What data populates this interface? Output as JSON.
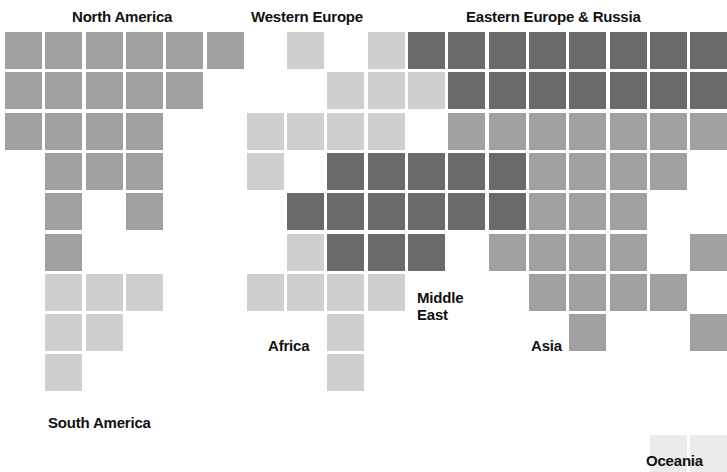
{
  "chart_data": {
    "type": "heatmap",
    "title": "",
    "subtitle": "",
    "xlabel": "",
    "ylabel": "",
    "grid": false,
    "legend_position": "none",
    "cell_size": 37,
    "cell_pitch": 40.3,
    "origin": {
      "x": 5,
      "y": 32
    },
    "columns": 18,
    "rows": 10,
    "shades": {
      "light": "#cfcfcf",
      "medium": "#a0a0a0",
      "dark": "#6a6a6a",
      "pale": "#ebebeb"
    },
    "categories": [
      "North America",
      "South America",
      "Western Europe",
      "Eastern Europe & Russia",
      "Africa",
      "Middle East",
      "Asia",
      "Oceania"
    ],
    "cells": [
      {
        "r": 0,
        "c": 0,
        "v": "medium"
      },
      {
        "r": 0,
        "c": 1,
        "v": "medium"
      },
      {
        "r": 0,
        "c": 2,
        "v": "medium"
      },
      {
        "r": 0,
        "c": 3,
        "v": "medium"
      },
      {
        "r": 0,
        "c": 4,
        "v": "medium"
      },
      {
        "r": 0,
        "c": 5,
        "v": "medium"
      },
      {
        "r": 0,
        "c": 7,
        "v": "light"
      },
      {
        "r": 0,
        "c": 9,
        "v": "light"
      },
      {
        "r": 0,
        "c": 10,
        "v": "dark"
      },
      {
        "r": 0,
        "c": 11,
        "v": "dark"
      },
      {
        "r": 0,
        "c": 12,
        "v": "dark"
      },
      {
        "r": 0,
        "c": 13,
        "v": "dark"
      },
      {
        "r": 0,
        "c": 14,
        "v": "dark"
      },
      {
        "r": 0,
        "c": 15,
        "v": "dark"
      },
      {
        "r": 0,
        "c": 16,
        "v": "dark"
      },
      {
        "r": 0,
        "c": 17,
        "v": "dark"
      },
      {
        "r": 1,
        "c": 0,
        "v": "medium"
      },
      {
        "r": 1,
        "c": 1,
        "v": "medium"
      },
      {
        "r": 1,
        "c": 2,
        "v": "medium"
      },
      {
        "r": 1,
        "c": 3,
        "v": "medium"
      },
      {
        "r": 1,
        "c": 4,
        "v": "medium"
      },
      {
        "r": 1,
        "c": 8,
        "v": "light"
      },
      {
        "r": 1,
        "c": 9,
        "v": "light"
      },
      {
        "r": 1,
        "c": 10,
        "v": "light"
      },
      {
        "r": 1,
        "c": 11,
        "v": "dark"
      },
      {
        "r": 1,
        "c": 12,
        "v": "dark"
      },
      {
        "r": 1,
        "c": 13,
        "v": "dark"
      },
      {
        "r": 1,
        "c": 14,
        "v": "dark"
      },
      {
        "r": 1,
        "c": 15,
        "v": "dark"
      },
      {
        "r": 1,
        "c": 16,
        "v": "dark"
      },
      {
        "r": 1,
        "c": 17,
        "v": "dark"
      },
      {
        "r": 2,
        "c": 0,
        "v": "medium"
      },
      {
        "r": 2,
        "c": 1,
        "v": "medium"
      },
      {
        "r": 2,
        "c": 2,
        "v": "medium"
      },
      {
        "r": 2,
        "c": 3,
        "v": "medium"
      },
      {
        "r": 2,
        "c": 6,
        "v": "light"
      },
      {
        "r": 2,
        "c": 7,
        "v": "light"
      },
      {
        "r": 2,
        "c": 8,
        "v": "light"
      },
      {
        "r": 2,
        "c": 9,
        "v": "light"
      },
      {
        "r": 2,
        "c": 11,
        "v": "medium"
      },
      {
        "r": 2,
        "c": 12,
        "v": "medium"
      },
      {
        "r": 2,
        "c": 13,
        "v": "medium"
      },
      {
        "r": 2,
        "c": 14,
        "v": "medium"
      },
      {
        "r": 2,
        "c": 15,
        "v": "medium"
      },
      {
        "r": 2,
        "c": 16,
        "v": "medium"
      },
      {
        "r": 2,
        "c": 17,
        "v": "medium"
      },
      {
        "r": 3,
        "c": 1,
        "v": "medium"
      },
      {
        "r": 3,
        "c": 2,
        "v": "medium"
      },
      {
        "r": 3,
        "c": 3,
        "v": "medium"
      },
      {
        "r": 3,
        "c": 6,
        "v": "light"
      },
      {
        "r": 3,
        "c": 8,
        "v": "dark"
      },
      {
        "r": 3,
        "c": 9,
        "v": "dark"
      },
      {
        "r": 3,
        "c": 10,
        "v": "dark"
      },
      {
        "r": 3,
        "c": 11,
        "v": "dark"
      },
      {
        "r": 3,
        "c": 12,
        "v": "dark"
      },
      {
        "r": 3,
        "c": 13,
        "v": "medium"
      },
      {
        "r": 3,
        "c": 14,
        "v": "medium"
      },
      {
        "r": 3,
        "c": 15,
        "v": "medium"
      },
      {
        "r": 3,
        "c": 16,
        "v": "medium"
      },
      {
        "r": 4,
        "c": 1,
        "v": "medium"
      },
      {
        "r": 4,
        "c": 3,
        "v": "medium"
      },
      {
        "r": 4,
        "c": 7,
        "v": "dark"
      },
      {
        "r": 4,
        "c": 8,
        "v": "dark"
      },
      {
        "r": 4,
        "c": 9,
        "v": "dark"
      },
      {
        "r": 4,
        "c": 10,
        "v": "dark"
      },
      {
        "r": 4,
        "c": 11,
        "v": "dark"
      },
      {
        "r": 4,
        "c": 12,
        "v": "dark"
      },
      {
        "r": 4,
        "c": 13,
        "v": "medium"
      },
      {
        "r": 4,
        "c": 14,
        "v": "medium"
      },
      {
        "r": 4,
        "c": 15,
        "v": "medium"
      },
      {
        "r": 5,
        "c": 1,
        "v": "medium"
      },
      {
        "r": 5,
        "c": 7,
        "v": "light"
      },
      {
        "r": 5,
        "c": 8,
        "v": "dark"
      },
      {
        "r": 5,
        "c": 9,
        "v": "dark"
      },
      {
        "r": 5,
        "c": 10,
        "v": "dark"
      },
      {
        "r": 5,
        "c": 12,
        "v": "medium"
      },
      {
        "r": 5,
        "c": 13,
        "v": "medium"
      },
      {
        "r": 5,
        "c": 14,
        "v": "medium"
      },
      {
        "r": 5,
        "c": 15,
        "v": "medium"
      },
      {
        "r": 5,
        "c": 17,
        "v": "medium"
      },
      {
        "r": 6,
        "c": 1,
        "v": "light"
      },
      {
        "r": 6,
        "c": 2,
        "v": "light"
      },
      {
        "r": 6,
        "c": 3,
        "v": "light"
      },
      {
        "r": 6,
        "c": 6,
        "v": "light"
      },
      {
        "r": 6,
        "c": 7,
        "v": "light"
      },
      {
        "r": 6,
        "c": 8,
        "v": "light"
      },
      {
        "r": 6,
        "c": 9,
        "v": "light"
      },
      {
        "r": 6,
        "c": 13,
        "v": "medium"
      },
      {
        "r": 6,
        "c": 14,
        "v": "medium"
      },
      {
        "r": 6,
        "c": 15,
        "v": "medium"
      },
      {
        "r": 6,
        "c": 16,
        "v": "medium"
      },
      {
        "r": 7,
        "c": 1,
        "v": "light"
      },
      {
        "r": 7,
        "c": 2,
        "v": "light"
      },
      {
        "r": 7,
        "c": 8,
        "v": "light"
      },
      {
        "r": 7,
        "c": 14,
        "v": "medium"
      },
      {
        "r": 7,
        "c": 17,
        "v": "medium"
      },
      {
        "r": 8,
        "c": 1,
        "v": "light"
      },
      {
        "r": 8,
        "c": 8,
        "v": "light"
      },
      {
        "r": 10,
        "c": 16,
        "v": "pale"
      },
      {
        "r": 10,
        "c": 17,
        "v": "pale"
      }
    ],
    "labels": [
      {
        "name": "north-america",
        "text": "North America",
        "x": 72,
        "y": 8,
        "align": "left"
      },
      {
        "name": "western-europe",
        "text": "Western Europe",
        "x": 251,
        "y": 8,
        "align": "left"
      },
      {
        "name": "eastern-europe-russia",
        "text": "Eastern Europe & Russia",
        "x": 466,
        "y": 8,
        "align": "left"
      },
      {
        "name": "middle-east",
        "text": "Middle\nEast",
        "x": 417,
        "y": 289,
        "align": "left"
      },
      {
        "name": "africa",
        "text": "Africa",
        "x": 268,
        "y": 337,
        "align": "left"
      },
      {
        "name": "asia",
        "text": "Asia",
        "x": 531,
        "y": 337,
        "align": "left"
      },
      {
        "name": "south-america",
        "text": "South America",
        "x": 48,
        "y": 414,
        "align": "left"
      },
      {
        "name": "oceania",
        "text": "Oceania",
        "x": 646,
        "y": 452,
        "align": "left"
      }
    ]
  }
}
